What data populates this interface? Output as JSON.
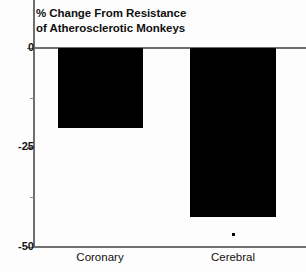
{
  "chart_data": {
    "type": "bar",
    "title": "% Change From Resistance of Atherosclerotic Monkeys",
    "title_lines": [
      "% Change From Resistance",
      "of Atherosclerotic Monkeys"
    ],
    "xlabel": "",
    "ylabel": "",
    "categories": [
      "Coronary",
      "Cerebral"
    ],
    "values": [
      -20,
      -42.5
    ],
    "ylim": [
      -50,
      0
    ],
    "yticks": [
      0,
      -25,
      -50
    ],
    "ytick_labels": [
      "0",
      "-25",
      "-50"
    ],
    "yminor_ticks": [
      -12.5,
      -37.5
    ],
    "grid": false,
    "legend": null,
    "bar_color": "#000000",
    "axis_color": "#6f6f6f",
    "annotations": [
      {
        "name": "significance-marker",
        "symbol": "*",
        "category": "Cerebral",
        "value": -46.5
      }
    ]
  }
}
